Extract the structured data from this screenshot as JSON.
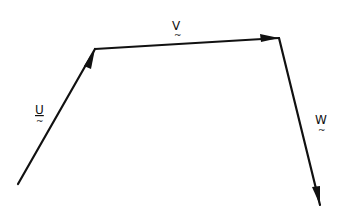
{
  "diagram": {
    "title": "",
    "vectors": [
      {
        "name": "U",
        "label": "U",
        "tilde": "~",
        "from": [
          18,
          184
        ],
        "to": [
          95,
          49
        ]
      },
      {
        "name": "V",
        "label": "V",
        "tilde": "~",
        "from": [
          95,
          49
        ],
        "to": [
          279,
          38
        ]
      },
      {
        "name": "W",
        "label": "W",
        "tilde": "~",
        "from": [
          279,
          38
        ],
        "to": [
          320,
          205
        ]
      }
    ],
    "colors": {
      "stroke": "#111111",
      "background": "#ffffff"
    }
  }
}
